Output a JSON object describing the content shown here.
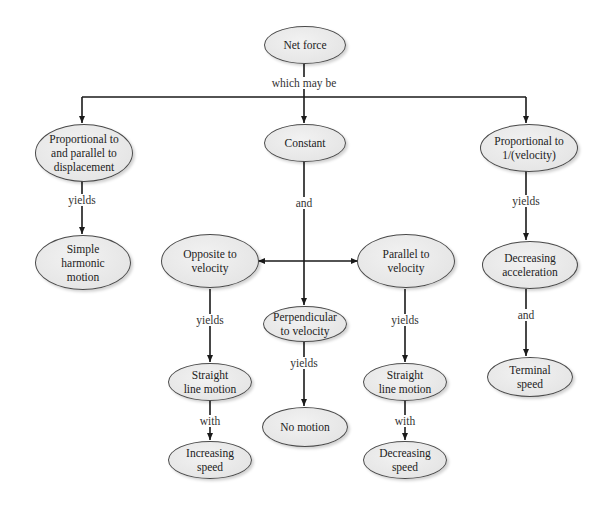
{
  "diagram": {
    "type": "concept-map",
    "nodes": {
      "net_force": "Net force",
      "proportional_displacement": "Proportional to\nand parallel to\ndisplacement",
      "constant": "Constant",
      "proportional_inverse_velocity": "Proportional to\n1/(velocity)",
      "simple_harmonic_motion": "Simple\nharmonic\nmotion",
      "opposite_to_velocity": "Opposite to\nvelocity",
      "parallel_to_velocity": "Parallel to\nvelocity",
      "perpendicular_to_velocity": "Perpendicular\nto velocity",
      "decreasing_acceleration": "Decreasing\nacceleration",
      "straight_line_motion_left": "Straight\nline motion",
      "straight_line_motion_right": "Straight\nline motion",
      "no_motion": "No motion",
      "terminal_speed": "Terminal\nspeed",
      "increasing_speed": "Increasing\nspeed",
      "decreasing_speed": "Decreasing\nspeed"
    },
    "edge_labels": {
      "which_may_be": "which may be",
      "yields_shm": "yields",
      "and_constant": "and",
      "yields_inverse": "yields",
      "yields_opposite": "yields",
      "yields_perpendicular": "yields",
      "yields_parallel": "yields",
      "and_decreasing_acc": "and",
      "with_left": "with",
      "with_right": "with"
    },
    "colors": {
      "node_fill": "#e6e6e6",
      "node_stroke": "#4a4a4a",
      "edge": "#1a1a1a",
      "text": "#222222"
    }
  }
}
